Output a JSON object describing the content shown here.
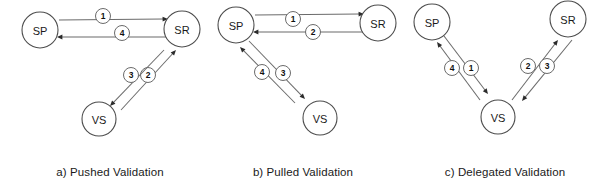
{
  "figure": {
    "width": 605,
    "height": 188,
    "background_color": "#ffffff",
    "stroke_color": "#6b6b6b",
    "node_stroke_color": "#4d4d4d",
    "text_color": "#1a1a1a"
  },
  "legend_nodes": {
    "sp": "SP",
    "sr": "SR",
    "vs": "VS"
  },
  "panels": [
    {
      "id": "panel-a",
      "caption": "a) Pushed Validation",
      "caption_x": 110,
      "caption_y": 172,
      "nodes": [
        {
          "name": "sp",
          "label": "SP",
          "cx": 40,
          "cy": 30,
          "r": 18
        },
        {
          "name": "sr",
          "label": "SR",
          "cx": 182,
          "cy": 29,
          "r": 18
        },
        {
          "name": "vs",
          "label": "VS",
          "cx": 99,
          "cy": 119,
          "r": 17
        }
      ],
      "edges": [
        {
          "name": "sp-to-sr",
          "step": "1",
          "from": "SP",
          "to": "SR",
          "x1": 59,
          "y1": 20,
          "x2": 168,
          "y2": 19,
          "label_x": 103,
          "label_y": 16,
          "label_r": 7.5
        },
        {
          "name": "sr-to-sp",
          "step": "4",
          "from": "SR",
          "to": "SP",
          "x1": 168,
          "y1": 37,
          "x2": 57,
          "y2": 37,
          "label_x": 122,
          "label_y": 33,
          "label_r": 7.5
        },
        {
          "name": "vs-to-sr",
          "step": "2",
          "from": "VS",
          "to": "SR",
          "x1": 121,
          "y1": 110,
          "x2": 176,
          "y2": 50,
          "label_x": 148,
          "label_y": 75,
          "label_r": 7.5
        },
        {
          "name": "sr-to-vs",
          "step": "3",
          "from": "SR",
          "to": "VS",
          "x1": 164,
          "y1": 50,
          "x2": 110,
          "y2": 106,
          "label_x": 131,
          "label_y": 75,
          "label_r": 7.5
        }
      ]
    },
    {
      "id": "panel-b",
      "caption": "b) Pulled Validation",
      "caption_x": 303,
      "caption_y": 172,
      "nodes": [
        {
          "name": "sp",
          "label": "SP",
          "cx": 236,
          "cy": 25,
          "r": 18
        },
        {
          "name": "sr",
          "label": "SR",
          "cx": 378,
          "cy": 23,
          "r": 18
        },
        {
          "name": "vs",
          "label": "VS",
          "cx": 320,
          "cy": 118,
          "r": 17
        }
      ],
      "edges": [
        {
          "name": "sp-to-sr",
          "step": "1",
          "from": "SP",
          "to": "SR",
          "x1": 255,
          "y1": 15,
          "x2": 364,
          "y2": 14,
          "label_x": 293,
          "label_y": 19,
          "label_r": 7.5
        },
        {
          "name": "sr-to-sp",
          "step": "2",
          "from": "SR",
          "to": "SP",
          "x1": 364,
          "y1": 32,
          "x2": 253,
          "y2": 32,
          "label_x": 313,
          "label_y": 32,
          "label_r": 7.5
        },
        {
          "name": "sp-to-vs",
          "step": "3",
          "from": "SP",
          "to": "VS",
          "x1": 249,
          "y1": 41,
          "x2": 305,
          "y2": 99,
          "label_x": 283,
          "label_y": 73,
          "label_r": 7.5
        },
        {
          "name": "vs-to-sp",
          "step": "4",
          "from": "VS",
          "to": "SP",
          "x1": 295,
          "y1": 103,
          "x2": 240,
          "y2": 47,
          "label_x": 262,
          "label_y": 72,
          "label_r": 7.5
        }
      ]
    },
    {
      "id": "panel-c",
      "caption": "c) Delegated Validation",
      "caption_x": 505,
      "caption_y": 172,
      "nodes": [
        {
          "name": "sp",
          "label": "SP",
          "cx": 432,
          "cy": 22,
          "r": 18
        },
        {
          "name": "sr",
          "label": "SR",
          "cx": 568,
          "cy": 19,
          "r": 18
        },
        {
          "name": "vs",
          "label": "VS",
          "cx": 498,
          "cy": 117,
          "r": 17
        }
      ],
      "edges": [
        {
          "name": "sp-to-vs",
          "step": "1",
          "from": "SP",
          "to": "VS",
          "x1": 444,
          "y1": 36,
          "x2": 488,
          "y2": 94,
          "label_x": 471,
          "label_y": 68,
          "label_r": 7.5
        },
        {
          "name": "vs-to-sp",
          "step": "4",
          "from": "VS",
          "to": "SP",
          "x1": 480,
          "y1": 100,
          "x2": 437,
          "y2": 42,
          "label_x": 452,
          "label_y": 68,
          "label_r": 7.5
        },
        {
          "name": "vs-to-sr",
          "step": "2",
          "from": "VS",
          "to": "SR",
          "x1": 512,
          "y1": 100,
          "x2": 558,
          "y2": 40,
          "label_x": 528,
          "label_y": 66,
          "label_r": 7.5
        },
        {
          "name": "sr-to-vs",
          "step": "3",
          "from": "SR",
          "to": "VS",
          "x1": 572,
          "y1": 40,
          "x2": 522,
          "y2": 101,
          "label_x": 547,
          "label_y": 66,
          "label_r": 7.5
        }
      ]
    }
  ]
}
